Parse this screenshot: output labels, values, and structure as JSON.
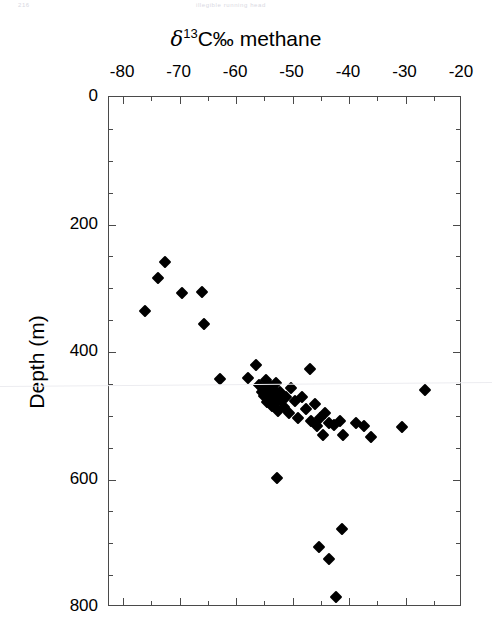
{
  "scan_header": {
    "left": "216",
    "center": "illegible running head"
  },
  "chart_data": {
    "type": "scatter",
    "title": "δ13C‰ methane",
    "title_parts": {
      "delta": "δ",
      "superscript": "13",
      "rest": "C‰ methane"
    },
    "xlabel": "δ13C‰ methane",
    "ylabel": "Depth (m)",
    "xlim": [
      -82.5,
      -20
    ],
    "ylim": [
      0,
      800
    ],
    "y_inverted": true,
    "x_axis_position": "top",
    "grid": false,
    "legend": false,
    "xticks": [
      -80,
      -70,
      -60,
      -50,
      -40,
      -30,
      -20
    ],
    "xticklabels": [
      "-80",
      "-70",
      "-60",
      "-50",
      "-40",
      "-30",
      "-20"
    ],
    "x_minor_interval": 5,
    "yticks": [
      0,
      200,
      400,
      600,
      800
    ],
    "yticklabels": [
      "0",
      "200",
      "400",
      "600",
      "800"
    ],
    "y_minor_interval": 50,
    "marker": "diamond",
    "marker_color": "#000000",
    "series": [
      {
        "name": "methane δ13C vs depth",
        "points": [
          [
            -72.6,
            259
          ],
          [
            -73.8,
            284
          ],
          [
            -76.1,
            336
          ],
          [
            -69.6,
            308
          ],
          [
            -66.1,
            306
          ],
          [
            -65.7,
            356
          ],
          [
            -62.9,
            442
          ],
          [
            -57.9,
            441
          ],
          [
            -56.5,
            421
          ],
          [
            -55.9,
            452
          ],
          [
            -55.4,
            462
          ],
          [
            -55.1,
            469
          ],
          [
            -54.9,
            455
          ],
          [
            -54.7,
            444
          ],
          [
            -54.5,
            478
          ],
          [
            -54.3,
            466
          ],
          [
            -54.2,
            451
          ],
          [
            -54.0,
            461
          ],
          [
            -53.8,
            472
          ],
          [
            -53.6,
            484
          ],
          [
            -53.4,
            458
          ],
          [
            -53.2,
            467
          ],
          [
            -53.0,
            449
          ],
          [
            -52.8,
            478
          ],
          [
            -52.6,
            492
          ],
          [
            -52.3,
            463
          ],
          [
            -52.0,
            475
          ],
          [
            -51.6,
            487
          ],
          [
            -51.2,
            470
          ],
          [
            -50.7,
            496
          ],
          [
            -50.2,
            456
          ],
          [
            -49.6,
            477
          ],
          [
            -49.0,
            504
          ],
          [
            -48.3,
            470
          ],
          [
            -47.6,
            490
          ],
          [
            -47.0,
            426
          ],
          [
            -46.8,
            509
          ],
          [
            -46.0,
            482
          ],
          [
            -45.6,
            516
          ],
          [
            -45.1,
            504
          ],
          [
            -44.6,
            530
          ],
          [
            -44.3,
            496
          ],
          [
            -43.6,
            511
          ],
          [
            -42.7,
            515
          ],
          [
            -41.6,
            508
          ],
          [
            -41.0,
            530
          ],
          [
            -38.8,
            511
          ],
          [
            -37.3,
            516
          ],
          [
            -36.2,
            534
          ],
          [
            -30.6,
            518
          ],
          [
            -26.5,
            460
          ],
          [
            -52.7,
            597
          ],
          [
            -41.2,
            677
          ],
          [
            -45.3,
            706
          ],
          [
            -43.6,
            725
          ],
          [
            -42.3,
            785
          ]
        ]
      }
    ]
  }
}
